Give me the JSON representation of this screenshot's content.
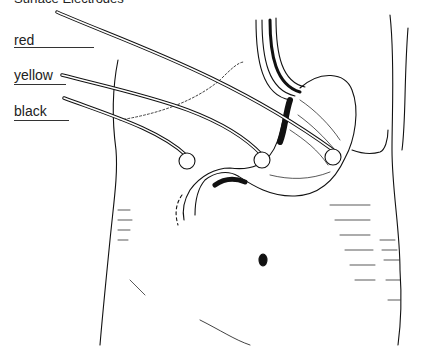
{
  "figure": {
    "title": "Surface Electrodes"
  },
  "labels": [
    {
      "text": "red",
      "top": 32,
      "line_y": 47,
      "line_w": 80
    },
    {
      "text": "yellow",
      "top": 67,
      "line_y": 84,
      "line_w": 52
    },
    {
      "text": "black",
      "top": 103,
      "line_y": 120,
      "line_w": 55
    }
  ],
  "electrodes": [
    {
      "wire": "black",
      "cx": 187,
      "cy": 161,
      "r": 8
    },
    {
      "wire": "yellow",
      "cx": 262,
      "cy": 160,
      "r": 8
    },
    {
      "wire": "red",
      "cx": 333,
      "cy": 157,
      "r": 8
    }
  ],
  "colors": {
    "ink": "#111111",
    "background": "#ffffff"
  }
}
